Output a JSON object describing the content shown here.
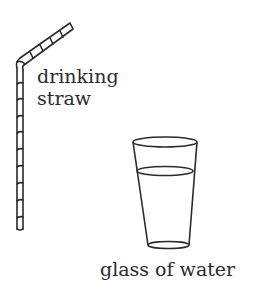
{
  "diagram": {
    "items": [
      {
        "id": "straw",
        "label_line1": "drinking",
        "label_line2": "straw",
        "icon": "drinking-straw-icon"
      },
      {
        "id": "glass",
        "label": "glass of water",
        "icon": "glass-of-water-icon"
      }
    ],
    "stroke_color": "#2b2b2b",
    "background": "#ffffff"
  }
}
